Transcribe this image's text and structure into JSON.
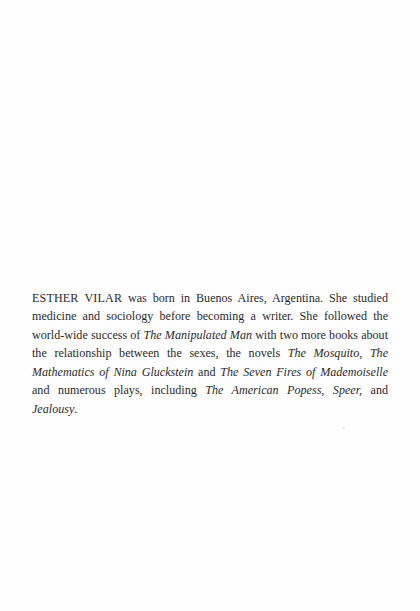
{
  "page": {
    "kind": "scanned-book-page",
    "background_color": "#fefefe",
    "text_color": "#2b2b2b"
  },
  "biography": {
    "author_name": "ESTHER VILAR",
    "segments": [
      {
        "text": "ESTHER VILAR",
        "style": "caps"
      },
      {
        "text": " was born in Buenos Aires, Argentina. She studied medicine and sociology before becoming a writer. She followed the world-wide success of ",
        "style": "roman"
      },
      {
        "text": "The Manipulated Man",
        "style": "italic"
      },
      {
        "text": " with two more books about the relationship between the sexes, the novels ",
        "style": "roman"
      },
      {
        "text": "The Mosquito",
        "style": "italic"
      },
      {
        "text": ", ",
        "style": "roman"
      },
      {
        "text": "The Mathematics of Nina Gluckstein",
        "style": "italic"
      },
      {
        "text": " and ",
        "style": "roman"
      },
      {
        "text": "The Seven Fires of Mademoiselle",
        "style": "italic"
      },
      {
        "text": " and numerous plays, including ",
        "style": "roman"
      },
      {
        "text": "The American Popess",
        "style": "italic"
      },
      {
        "text": ", ",
        "style": "roman"
      },
      {
        "text": "Speer,",
        "style": "italic"
      },
      {
        "text": " and ",
        "style": "roman"
      },
      {
        "text": "Jealousy",
        "style": "italic"
      },
      {
        "text": ".",
        "style": "roman"
      }
    ],
    "full_text": "ESTHER VILAR was born in Buenos Aires, Argentina. She studied medicine and sociology before becoming a writer. She followed the world-wide success of The Manipulated Man with two more books about the relationship between the sexes, the novels The Mosquito, The Mathematics of Nina Gluckstein and The Seven Fires of Mademoiselle and numerous plays, including The American Popess, Speer, and Jealousy.",
    "works_mentioned": [
      "The Manipulated Man",
      "The Mosquito",
      "The Mathematics of Nina Gluckstein",
      "The Seven Fires of Mademoiselle",
      "The American Popess",
      "Speer,",
      "Jealousy"
    ],
    "rendered_lines": [
      "ESTHER VILAR was born in Buenos Aires, Argentina. She studied",
      "medicine and sociology before becoming a writer. She followed the",
      "world-wide success of The Manipulated Man with two more books",
      "about the relationship between the sexes, the novels The Mosquito,",
      "The Mathematics of Nina Gluckstein and The Seven Fires of",
      "Mademoiselle and numerous plays, including The American Popess,",
      "Speer, and Jealousy."
    ]
  }
}
